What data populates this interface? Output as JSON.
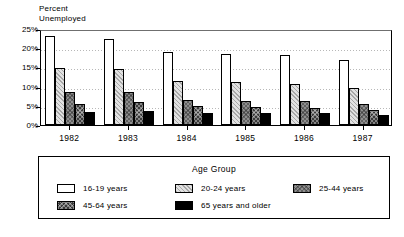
{
  "chart_data": {
    "type": "bar",
    "title": "",
    "ylabel": "Percent\nUnemployed",
    "xlabel": "",
    "ylim": [
      0,
      25
    ],
    "yticks": [
      0,
      5,
      10,
      15,
      20,
      25
    ],
    "ytick_labels": [
      "0%",
      "5%",
      "10%",
      "15%",
      "20%",
      "25%"
    ],
    "grid": true,
    "legend_position": "bottom",
    "legend_title": "Age Group",
    "categories": [
      "1982",
      "1983",
      "1984",
      "1985",
      "1986",
      "1987"
    ],
    "series": [
      {
        "name": "16-19 years",
        "values": [
          23.2,
          22.4,
          18.9,
          18.6,
          18.3,
          16.9
        ]
      },
      {
        "name": "20-24 years",
        "values": [
          14.9,
          14.5,
          11.5,
          11.1,
          10.7,
          9.7
        ]
      },
      {
        "name": "25-44 years",
        "values": [
          8.6,
          8.5,
          6.4,
          6.2,
          6.3,
          5.4
        ]
      },
      {
        "name": "45-64 years",
        "values": [
          5.6,
          5.9,
          4.9,
          4.6,
          4.4,
          3.8
        ]
      },
      {
        "name": "65 years and older",
        "values": [
          3.5,
          3.7,
          3.2,
          3.1,
          3.0,
          2.5
        ]
      }
    ],
    "series_colors": [
      "#ffffff",
      "#e2e2e2",
      "#8e8e8e",
      "#3a3a3a",
      "#000000"
    ]
  },
  "legend": {
    "title": "Age Group",
    "rows": [
      [
        {
          "label": "16-19 years",
          "fill_index": 0
        },
        {
          "label": "20-24 years",
          "fill_index": 1
        },
        {
          "label": "25-44 years",
          "fill_index": 2
        }
      ],
      [
        {
          "label": "45-64 years",
          "fill_index": 3
        },
        {
          "label": "65 years and older",
          "fill_index": 4
        }
      ]
    ]
  }
}
